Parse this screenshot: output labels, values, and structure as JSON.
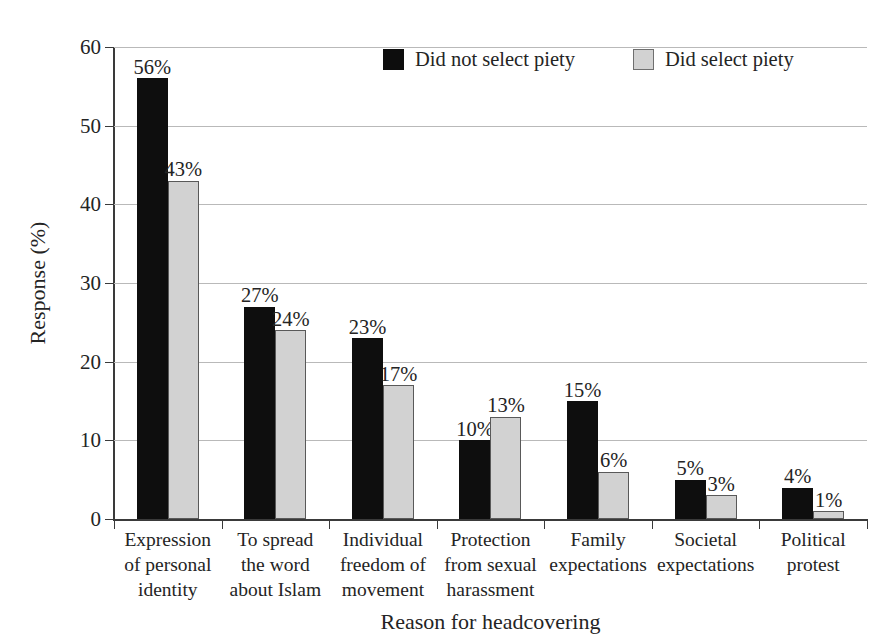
{
  "chart_data": {
    "type": "bar",
    "title": "",
    "xlabel": "Reason for headcovering",
    "ylabel": "Response (%)",
    "ylim": [
      0,
      60
    ],
    "ytick_step": 10,
    "yticks": [
      "0",
      "10",
      "20",
      "30",
      "40",
      "50",
      "60"
    ],
    "grid": "horizontal",
    "legend_position": "top-center",
    "value_label_suffix": "%",
    "categories": [
      "Expression of personal identity",
      "To spread the word about Islam",
      "Individual freedom of movement",
      "Protection from sexual harassment",
      "Family expectations",
      "Societal expectations",
      "Political protest"
    ],
    "category_lines": [
      [
        "Expression",
        "of personal",
        "identity"
      ],
      [
        "To spread",
        "the word",
        "about Islam"
      ],
      [
        "Individual",
        "freedom of",
        "movement"
      ],
      [
        "Protection",
        "from sexual",
        "harassment"
      ],
      [
        "Family",
        "expectations"
      ],
      [
        "Societal",
        "expectations"
      ],
      [
        "Political",
        "protest"
      ]
    ],
    "series": [
      {
        "name": "Did not select piety",
        "color": "#0e0e0e",
        "values": [
          56,
          27,
          23,
          10,
          15,
          5,
          4
        ],
        "value_labels": [
          "56%",
          "27%",
          "23%",
          "10%",
          "15%",
          "5%",
          "4%"
        ]
      },
      {
        "name": "Did select piety",
        "color": "#d2d2d2",
        "values": [
          43,
          24,
          17,
          13,
          6,
          3,
          1
        ],
        "value_labels": [
          "43%",
          "24%",
          "17%",
          "13%",
          "6%",
          "3%",
          "1%"
        ]
      }
    ]
  },
  "legend": {
    "entries": [
      {
        "label": "Did not select piety",
        "swatch": "dark"
      },
      {
        "label": "Did select piety",
        "swatch": "light"
      }
    ]
  },
  "colors": {
    "series_dark": "#0e0e0e",
    "series_light": "#d2d2d2",
    "series_light_border": "#595959",
    "axis": "#3a3a3a",
    "gridline": "#b9b9b9",
    "text": "#242424",
    "background": "#ffffff"
  }
}
